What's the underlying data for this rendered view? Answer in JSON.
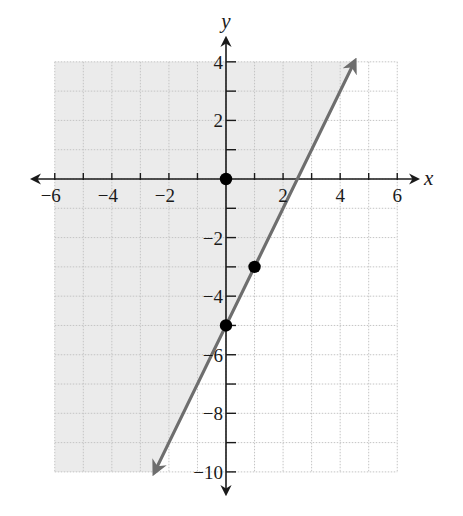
{
  "chart_data": {
    "type": "line",
    "title": "",
    "xlabel": "x",
    "ylabel": "y",
    "xlim": [
      -6,
      6
    ],
    "ylim": [
      -10,
      4
    ],
    "grid": true,
    "grid_step": 1,
    "x_tick_labels": [
      -6,
      -4,
      -2,
      2,
      4,
      6
    ],
    "y_tick_labels": [
      4,
      2,
      -2,
      -4,
      -6,
      -8,
      -10
    ],
    "boundary_line": {
      "equation": "y = 2x - 5",
      "slope": 2,
      "intercept": -5,
      "style": "solid",
      "arrows": "both",
      "x_range": [
        -2.5,
        4.5
      ]
    },
    "shaded_region": "y >= 2x - 5",
    "points": [
      {
        "x": 0,
        "y": 0
      },
      {
        "x": 1,
        "y": -3
      },
      {
        "x": 0,
        "y": -5
      }
    ],
    "legend": null
  },
  "colors": {
    "shade": "#ebebeb",
    "grid": "#c4c4c4",
    "axis": "#1a1a1a",
    "line": "#6e6e6e",
    "point": "#000000"
  }
}
